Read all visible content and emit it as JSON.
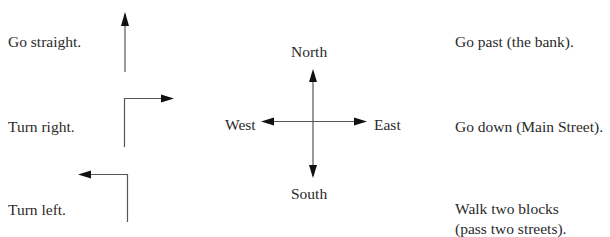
{
  "left_column": {
    "items": [
      {
        "label": "Go straight.",
        "icon": "straight-arrow-icon"
      },
      {
        "label": "Turn right.",
        "icon": "turn-right-arrow-icon"
      },
      {
        "label": "Turn left.",
        "icon": "turn-left-arrow-icon"
      }
    ]
  },
  "compass": {
    "north": "North",
    "south": "South",
    "east": "East",
    "west": "West",
    "icon": "compass-cross-arrows-icon"
  },
  "right_column": {
    "items": [
      {
        "lines": [
          "Go past (the bank)."
        ]
      },
      {
        "lines": [
          "Go down (Main Street)."
        ]
      },
      {
        "lines": [
          "Walk two blocks",
          "(pass two streets)."
        ]
      }
    ]
  },
  "colors": {
    "text": "#2a2a2a",
    "line": "#555555",
    "arrowhead": "#111111",
    "background": "#ffffff"
  }
}
